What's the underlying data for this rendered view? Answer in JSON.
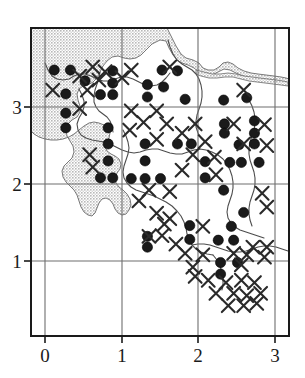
{
  "figure": {
    "title": "",
    "type": "distribution-map",
    "background_color": "#ffffff",
    "frame_color": "#1a1a1a",
    "grid_color": "#6e6e6e",
    "sea_fill_color": "#c9c9c9",
    "coastline_color": "#555555",
    "dot_color": "#1a1a1a",
    "cross_color": "#2a2a2a"
  },
  "axes": {
    "x_ticks": [
      "0",
      "1",
      "2",
      "3"
    ],
    "y_ticks": [
      "3",
      "2",
      "1"
    ],
    "x_label": "",
    "y_label": "",
    "xlim": [
      -0.2,
      3.2
    ],
    "ylim": [
      0.0,
      3.8
    ]
  },
  "legend": {
    "present": false,
    "entries": [
      {
        "symbol": "filled-circle",
        "label": ""
      },
      {
        "symbol": "cross",
        "label": ""
      }
    ]
  },
  "chart_data": {
    "type": "scatter",
    "title": "",
    "xlabel": "",
    "ylabel": "",
    "xlim": [
      -0.2,
      3.2
    ],
    "ylim": [
      0.0,
      3.8
    ],
    "xticks": [
      0,
      1,
      2,
      3
    ],
    "yticks": [
      1,
      2,
      3
    ],
    "grid": true,
    "series": [
      {
        "name": "filled-circle",
        "marker": "filled-circle",
        "color": "#1a1a1a",
        "points": [
          [
            0.12,
            3.48
          ],
          [
            0.33,
            3.48
          ],
          [
            0.88,
            3.47
          ],
          [
            1.52,
            3.48
          ],
          [
            1.72,
            3.47
          ],
          [
            0.52,
            3.34
          ],
          [
            1.33,
            3.29
          ],
          [
            1.54,
            3.26
          ],
          [
            0.88,
            3.31
          ],
          [
            0.27,
            3.17
          ],
          [
            0.72,
            3.16
          ],
          [
            0.88,
            3.16
          ],
          [
            1.33,
            3.13
          ],
          [
            1.82,
            3.1
          ],
          [
            2.32,
            3.09
          ],
          [
            2.62,
            3.12
          ],
          [
            0.27,
            2.92
          ],
          [
            2.33,
            2.78
          ],
          [
            2.72,
            2.82
          ],
          [
            0.27,
            2.73
          ],
          [
            0.82,
            2.73
          ],
          [
            2.33,
            2.66
          ],
          [
            2.72,
            2.66
          ],
          [
            0.82,
            2.52
          ],
          [
            1.3,
            2.52
          ],
          [
            1.72,
            2.52
          ],
          [
            1.9,
            2.52
          ],
          [
            2.52,
            2.51
          ],
          [
            2.72,
            2.52
          ],
          [
            0.82,
            2.3
          ],
          [
            1.3,
            2.3
          ],
          [
            2.08,
            2.29
          ],
          [
            2.4,
            2.28
          ],
          [
            2.55,
            2.28
          ],
          [
            2.78,
            2.28
          ],
          [
            0.72,
            2.08
          ],
          [
            0.88,
            2.08
          ],
          [
            1.12,
            2.07
          ],
          [
            1.3,
            2.07
          ],
          [
            1.5,
            2.07
          ],
          [
            2.08,
            2.08
          ],
          [
            2.32,
            1.92
          ],
          [
            2.58,
            1.63
          ],
          [
            1.88,
            1.46
          ],
          [
            2.42,
            1.45
          ],
          [
            1.33,
            1.32
          ],
          [
            1.88,
            1.28
          ],
          [
            2.25,
            1.27
          ],
          [
            2.45,
            1.27
          ],
          [
            1.33,
            1.18
          ],
          [
            2.28,
            0.98
          ],
          [
            2.5,
            0.98
          ],
          [
            2.28,
            0.83
          ]
        ]
      },
      {
        "name": "cross",
        "marker": "x-cross",
        "color": "#2a2a2a",
        "points": [
          [
            0.62,
            3.52
          ],
          [
            0.78,
            3.46
          ],
          [
            1.12,
            3.48
          ],
          [
            1.62,
            3.52
          ],
          [
            0.45,
            3.4
          ],
          [
            0.7,
            3.35
          ],
          [
            1.0,
            3.38
          ],
          [
            0.1,
            3.22
          ],
          [
            0.55,
            3.22
          ],
          [
            2.58,
            3.22
          ],
          [
            0.45,
            2.98
          ],
          [
            1.12,
            2.95
          ],
          [
            1.45,
            2.95
          ],
          [
            1.28,
            2.8
          ],
          [
            1.58,
            2.78
          ],
          [
            1.95,
            2.78
          ],
          [
            2.45,
            2.78
          ],
          [
            2.85,
            2.77
          ],
          [
            1.1,
            2.7
          ],
          [
            1.78,
            2.66
          ],
          [
            1.45,
            2.58
          ],
          [
            2.08,
            2.55
          ],
          [
            2.58,
            2.52
          ],
          [
            2.88,
            2.5
          ],
          [
            0.58,
            2.38
          ],
          [
            1.92,
            2.38
          ],
          [
            2.2,
            2.35
          ],
          [
            0.62,
            2.22
          ],
          [
            1.78,
            2.18
          ],
          [
            2.22,
            2.12
          ],
          [
            1.35,
            1.92
          ],
          [
            1.62,
            1.9
          ],
          [
            2.82,
            1.88
          ],
          [
            1.22,
            1.78
          ],
          [
            2.88,
            1.7
          ],
          [
            1.45,
            1.62
          ],
          [
            1.62,
            1.55
          ],
          [
            1.55,
            1.48
          ],
          [
            2.05,
            1.45
          ],
          [
            1.52,
            1.33
          ],
          [
            1.35,
            1.32
          ],
          [
            1.7,
            1.22
          ],
          [
            2.7,
            1.18
          ],
          [
            2.88,
            1.18
          ],
          [
            1.82,
            1.1
          ],
          [
            2.05,
            1.08
          ],
          [
            2.45,
            1.1
          ],
          [
            2.62,
            1.08
          ],
          [
            2.85,
            1.05
          ],
          [
            1.92,
            0.92
          ],
          [
            2.55,
            0.95
          ],
          [
            1.95,
            0.8
          ],
          [
            2.12,
            0.75
          ],
          [
            2.35,
            0.72
          ],
          [
            2.55,
            0.75
          ],
          [
            2.72,
            0.72
          ],
          [
            2.22,
            0.58
          ],
          [
            2.45,
            0.58
          ],
          [
            2.62,
            0.55
          ],
          [
            2.8,
            0.58
          ],
          [
            2.38,
            0.42
          ],
          [
            2.58,
            0.42
          ],
          [
            2.75,
            0.45
          ]
        ]
      }
    ]
  }
}
